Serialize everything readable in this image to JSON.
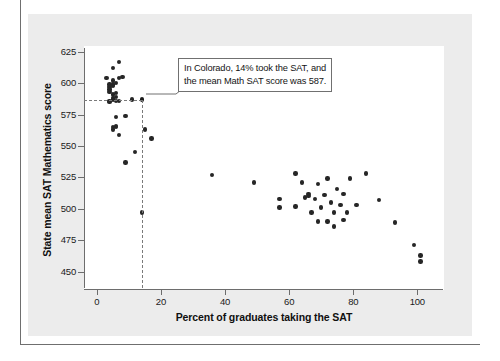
{
  "chart_data": {
    "type": "scatter",
    "title": "",
    "xlabel": "Percent of graduates taking the SAT",
    "ylabel": "State mean SAT Mathematics score",
    "xlim": [
      -4,
      108
    ],
    "ylim": [
      437,
      628
    ],
    "xticks": [
      0,
      20,
      40,
      60,
      80,
      100
    ],
    "yticks": [
      450,
      475,
      500,
      525,
      550,
      575,
      600,
      625
    ],
    "grid": false,
    "legend": null,
    "marker_color": "#262626",
    "points": [
      {
        "x": 3,
        "y": 604
      },
      {
        "x": 4,
        "y": 599
      },
      {
        "x": 4,
        "y": 597
      },
      {
        "x": 4,
        "y": 595
      },
      {
        "x": 4,
        "y": 593
      },
      {
        "x": 4,
        "y": 586
      },
      {
        "x": 4,
        "y": 585
      },
      {
        "x": 5,
        "y": 612
      },
      {
        "x": 5,
        "y": 602
      },
      {
        "x": 5,
        "y": 599
      },
      {
        "x": 5,
        "y": 598
      },
      {
        "x": 5,
        "y": 591
      },
      {
        "x": 5,
        "y": 588
      },
      {
        "x": 5,
        "y": 587
      },
      {
        "x": 5,
        "y": 565
      },
      {
        "x": 5,
        "y": 563
      },
      {
        "x": 6,
        "y": 600
      },
      {
        "x": 6,
        "y": 592
      },
      {
        "x": 6,
        "y": 589
      },
      {
        "x": 6,
        "y": 586
      },
      {
        "x": 6,
        "y": 573
      },
      {
        "x": 6,
        "y": 566
      },
      {
        "x": 6,
        "y": 565
      },
      {
        "x": 7,
        "y": 617
      },
      {
        "x": 7,
        "y": 604
      },
      {
        "x": 7,
        "y": 586
      },
      {
        "x": 7,
        "y": 559
      },
      {
        "x": 8,
        "y": 605
      },
      {
        "x": 9,
        "y": 574
      },
      {
        "x": 9,
        "y": 537
      },
      {
        "x": 11,
        "y": 587
      },
      {
        "x": 12,
        "y": 545
      },
      {
        "x": 14,
        "y": 587,
        "label": "Colorado",
        "highlight": true
      },
      {
        "x": 15,
        "y": 563
      },
      {
        "x": 14,
        "y": 497
      },
      {
        "x": 17,
        "y": 556
      },
      {
        "x": 36,
        "y": 527
      },
      {
        "x": 49,
        "y": 521
      },
      {
        "x": 57,
        "y": 508
      },
      {
        "x": 57,
        "y": 501
      },
      {
        "x": 62,
        "y": 502
      },
      {
        "x": 62,
        "y": 528
      },
      {
        "x": 64,
        "y": 521
      },
      {
        "x": 65,
        "y": 509
      },
      {
        "x": 66,
        "y": 512
      },
      {
        "x": 66,
        "y": 510
      },
      {
        "x": 67,
        "y": 497
      },
      {
        "x": 68,
        "y": 508
      },
      {
        "x": 69,
        "y": 520
      },
      {
        "x": 69,
        "y": 490
      },
      {
        "x": 70,
        "y": 501
      },
      {
        "x": 71,
        "y": 511
      },
      {
        "x": 72,
        "y": 524
      },
      {
        "x": 72,
        "y": 490
      },
      {
        "x": 73,
        "y": 505
      },
      {
        "x": 74,
        "y": 497
      },
      {
        "x": 74,
        "y": 486
      },
      {
        "x": 75,
        "y": 516
      },
      {
        "x": 76,
        "y": 503
      },
      {
        "x": 77,
        "y": 512
      },
      {
        "x": 77,
        "y": 491
      },
      {
        "x": 78,
        "y": 497
      },
      {
        "x": 79,
        "y": 524
      },
      {
        "x": 81,
        "y": 503
      },
      {
        "x": 84,
        "y": 528
      },
      {
        "x": 88,
        "y": 507
      },
      {
        "x": 93,
        "y": 489
      },
      {
        "x": 99,
        "y": 471
      },
      {
        "x": 101,
        "y": 463
      },
      {
        "x": 101,
        "y": 458
      }
    ],
    "annotation": {
      "line1": "In Colorado, 14% took the SAT, and",
      "line2": "the mean Math SAT score was 587.",
      "target_x": 14,
      "target_y": 587
    },
    "reference_lines": {
      "vertical_at_x": 14,
      "horizontal_at_y": 587
    }
  }
}
